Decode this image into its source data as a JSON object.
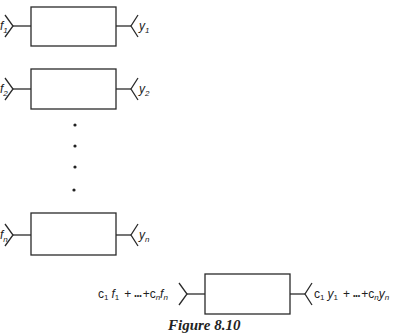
{
  "figure": {
    "caption": "Figure 8.10"
  },
  "systems": [
    {
      "input": "f",
      "input_sub": "1",
      "output": "y",
      "output_sub": "1",
      "box": {
        "x": 31,
        "y": 7,
        "w": 85,
        "h": 39
      }
    },
    {
      "input": "f",
      "input_sub": "2",
      "output": "y",
      "output_sub": "2",
      "box": {
        "x": 31,
        "y": 69,
        "w": 85,
        "h": 40
      }
    },
    {
      "input": "f",
      "input_sub": "n",
      "output": "y",
      "output_sub": "n",
      "box": {
        "x": 31,
        "y": 213,
        "w": 85,
        "h": 42
      }
    }
  ],
  "ellipsis_dots": [
    125,
    146,
    167,
    190
  ],
  "combined": {
    "input_label": "c₁f₁ + ••• + cₙfₙ",
    "input_parts": {
      "c1": "c",
      "s1": "1",
      "f1": "f",
      "s2": "1",
      "plus1": "+",
      "dots": "•••",
      "plus2": "+",
      "cn": "c",
      "s3": "n",
      "fn": "f",
      "s4": "n"
    },
    "output_label": "c₁y₁ + ••• + cₙyₙ",
    "output_parts": {
      "c1": "c",
      "s1": "1",
      "y1": "y",
      "s2": "1",
      "plus1": "+",
      "dots": "•••",
      "plus2": "+",
      "cn": "c",
      "s3": "n",
      "yn": "y",
      "s4": "n"
    },
    "box": {
      "x": 205,
      "y": 274,
      "w": 85,
      "h": 40
    }
  },
  "colors": {
    "stroke": "#2a2a2a",
    "background": "#ffffff"
  }
}
